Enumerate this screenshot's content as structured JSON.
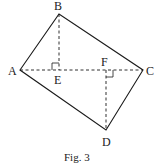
{
  "figure": {
    "caption": "Fig. 3",
    "points": {
      "A": {
        "label": "A",
        "x": 20,
        "y": 70
      },
      "B": {
        "label": "B",
        "x": 59,
        "y": 14
      },
      "C": {
        "label": "C",
        "x": 143,
        "y": 70
      },
      "D": {
        "label": "D",
        "x": 106,
        "y": 130
      },
      "E": {
        "label": "E",
        "x": 59,
        "y": 70
      },
      "F": {
        "label": "F",
        "x": 106,
        "y": 70
      }
    },
    "solid_segments": [
      "AB",
      "BC",
      "CD",
      "DA"
    ],
    "dashed_segments": [
      "AC",
      "BE",
      "DF"
    ],
    "right_angles": [
      "E",
      "F"
    ],
    "colors": {
      "stroke": "#1a1a1a",
      "background": "#ffffff"
    }
  }
}
